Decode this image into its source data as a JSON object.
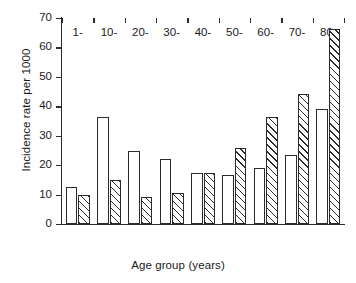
{
  "chart_data": {
    "type": "bar",
    "title": "",
    "xlabel": "Age group (years)",
    "ylabel": "Incidence rate per 1000",
    "categories": [
      "1-",
      "10-",
      "20-",
      "30-",
      "40-",
      "50-",
      "60-",
      "70-",
      "80-"
    ],
    "series": [
      {
        "name": "open",
        "fill": "open",
        "values": [
          12.5,
          36.5,
          24.8,
          22.0,
          17.5,
          16.5,
          19.0,
          23.5,
          39.0
        ]
      },
      {
        "name": "hatched",
        "fill": "hatched",
        "values": [
          10.0,
          15.0,
          9.3,
          10.7,
          17.3,
          25.8,
          36.5,
          44.3,
          66.3
        ]
      }
    ],
    "ylim": [
      0,
      70
    ],
    "yticks": [
      0,
      10,
      20,
      30,
      40,
      50,
      60,
      70
    ],
    "ytick_labels": [
      "0",
      "10",
      "20",
      "30",
      "40",
      "50",
      "60",
      "70"
    ],
    "grid": false,
    "legend": "none",
    "axis_color": "#2b2b2b",
    "bar_face_color": "#ffffff",
    "hatch_color": "#2b2b2b"
  }
}
